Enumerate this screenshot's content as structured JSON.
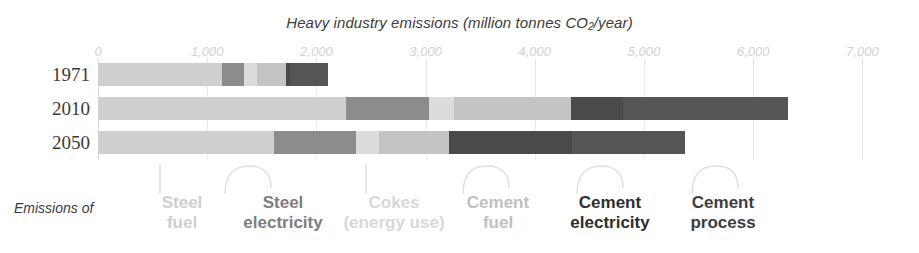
{
  "chart_data": {
    "type": "bar",
    "orientation": "horizontal",
    "stacked": true,
    "title": "Heavy industry emissions (million tonnes CO2/year)",
    "xlabel": "",
    "ylabel": "",
    "xlim": [
      0,
      7000
    ],
    "xticks": [
      0,
      1000,
      2000,
      3000,
      4000,
      5000,
      6000,
      7000
    ],
    "xtick_labels": [
      "0",
      "1,000",
      "2,000",
      "3,000",
      "4,000",
      "5,000",
      "6,000",
      "7,000"
    ],
    "grid": true,
    "legend_position": "bottom",
    "categories": [
      "1971",
      "2010",
      "2050"
    ],
    "series": [
      {
        "name": "Steel fuel",
        "color": "#cfcfcf",
        "values": [
          1140,
          2270,
          1610
        ]
      },
      {
        "name": "Steel electricity",
        "color": "#8c8c8c",
        "values": [
          200,
          760,
          755
        ]
      },
      {
        "name": "Cokes (energy use)",
        "color": "#dcdcdc",
        "values": [
          120,
          230,
          210
        ]
      },
      {
        "name": "Cement fuel",
        "color": "#c4c4c4",
        "values": [
          260,
          1070,
          640
        ]
      },
      {
        "name": "Cement electricity",
        "color": "#4a4a4a",
        "values": [
          40,
          480,
          1130
        ]
      },
      {
        "name": "Cement process",
        "color": "#555555",
        "values": [
          350,
          1510,
          1035
        ]
      }
    ],
    "totals": [
      2110,
      6320,
      5380
    ]
  },
  "legend": {
    "intro": "Emissions of",
    "items": [
      {
        "line1": "Steel",
        "line2": "fuel",
        "color": "#cfcfcf"
      },
      {
        "line1": "Steel",
        "line2": "electricity",
        "color": "#7e7e7e"
      },
      {
        "line1": "Cokes",
        "line2": "(energy use)",
        "color": "#d8d8d8"
      },
      {
        "line1": "Cement",
        "line2": "fuel",
        "color": "#c0c0c0"
      },
      {
        "line1": "Cement",
        "line2": "electricity",
        "color": "#2e2e2e"
      },
      {
        "line1": "Cement",
        "line2": "process",
        "color": "#3d3d3d"
      }
    ]
  }
}
